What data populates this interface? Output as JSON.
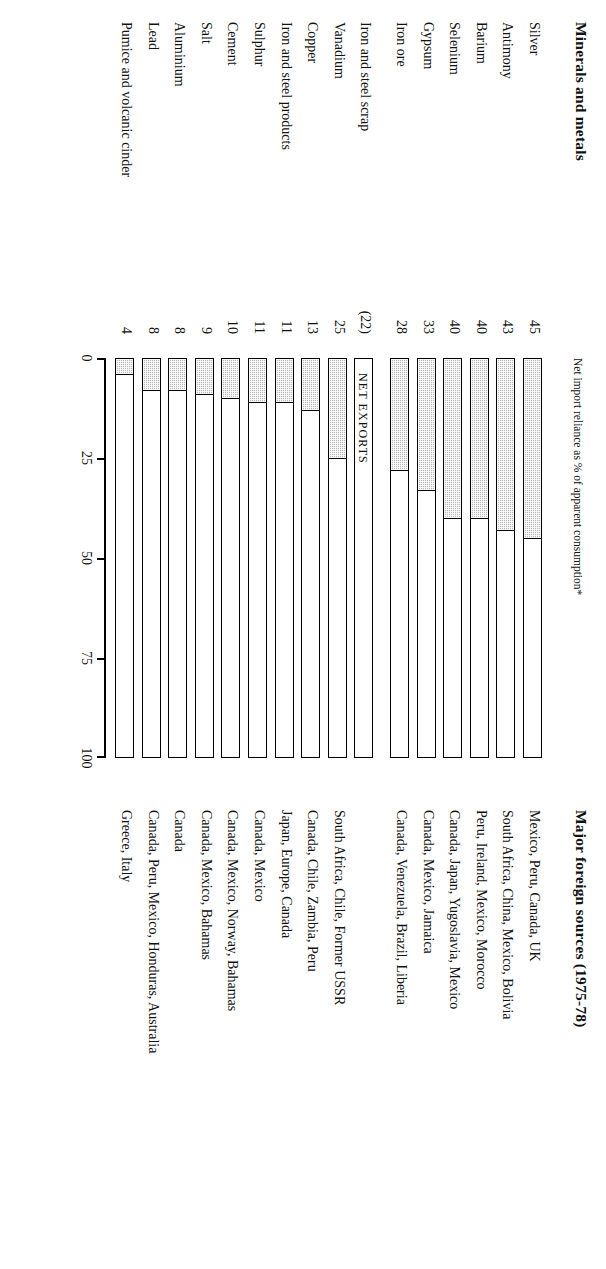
{
  "headers": {
    "minerals_title": "Minerals and metals",
    "sources_title": "Major foreign sources (1975-78)",
    "axis_subtitle": "Net import reliance as % of apparent consumption*"
  },
  "net_exports_label": "NET EXPORTS",
  "chart_data": {
    "type": "bar",
    "title": "Minerals and metals",
    "xlabel": "Net import reliance as % of apparent consumption*",
    "ylabel": "",
    "xlim": [
      0,
      100
    ],
    "grid": false,
    "legend": null,
    "orientation": "horizontal",
    "ticks": [
      "0",
      "25",
      "50",
      "75",
      "100"
    ],
    "tick_values": [
      0,
      25,
      50,
      75,
      100
    ],
    "categories": [
      "Silver",
      "Antimony",
      "Barium",
      "Selenium",
      "Gypsum",
      "Iron ore",
      "Iron and steel scrap",
      "Vanadium",
      "Copper",
      "Iron and steel products",
      "Sulphur",
      "Cement",
      "Salt",
      "Aluminium",
      "Lead",
      "Pumice and volcanic cinder"
    ],
    "values": [
      45,
      43,
      40,
      40,
      33,
      28,
      -22,
      25,
      13,
      11,
      11,
      10,
      9,
      8,
      8,
      4
    ],
    "value_labels": [
      "45",
      "43",
      "40",
      "40",
      "33",
      "28",
      "(22)",
      "25",
      "13",
      "11",
      "11",
      "10",
      "9",
      "8",
      "8",
      "4"
    ],
    "sources": [
      "Mexico, Peru, Canada, UK",
      "South Africa, China, Mexico, Bolivia",
      "Peru, Ireland, Mexico, Morocco",
      "Canada, Japan, Yugoslavia, Mexico",
      "Canada, Mexico, Jamaica",
      "Canada, Venezuela, Brazil, Liberia",
      "",
      "South Africa, Chile, Former USSR",
      "Canada, Chile, Zambia, Peru",
      "Japan, Europe, Canada",
      "Canada, Mexico",
      "Canada, Mexico, Norway, Bahamas",
      "Canada, Mexico, Bahamas",
      "Canada",
      "Canada, Peru, Mexico, Honduras, Australia",
      "Greece, Italy"
    ]
  },
  "colors": {
    "bar_fill": "#b6b6b6",
    "bar_outline": "#000000",
    "text": "#111111",
    "background": "#ffffff"
  }
}
